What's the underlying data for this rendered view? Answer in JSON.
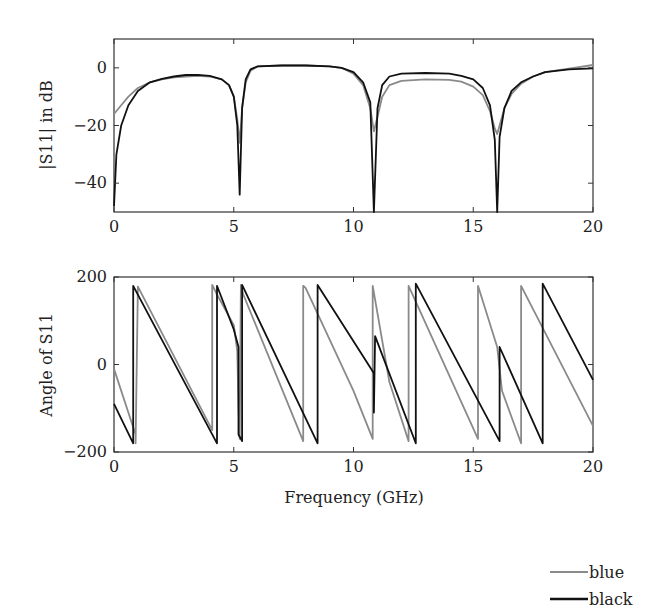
{
  "chart_data": [
    {
      "type": "line",
      "title": "",
      "xlabel": "",
      "ylabel": "|S11| in dB",
      "xlim": [
        0,
        20
      ],
      "ylim": [
        -50,
        10
      ],
      "xticks": [
        0,
        5,
        10,
        15,
        20
      ],
      "xtick_labels": [
        "0",
        "5",
        "10",
        "15",
        "20"
      ],
      "yticks": [
        0,
        -20,
        -40
      ],
      "ytick_labels": [
        "0",
        "−20",
        "−40"
      ],
      "grid": false,
      "series": [
        {
          "name": "blue",
          "color": "#8a8a8a",
          "x": [
            0,
            0.3,
            0.6,
            1.0,
            1.5,
            2.0,
            2.5,
            3.0,
            3.5,
            4.0,
            4.5,
            4.8,
            5.0,
            5.15,
            5.25,
            5.35,
            5.5,
            5.7,
            6.0,
            7.0,
            8.0,
            9.0,
            9.5,
            10.0,
            10.4,
            10.7,
            10.85,
            11.0,
            11.2,
            11.5,
            12.0,
            13.0,
            14.0,
            14.5,
            15.0,
            15.4,
            15.7,
            15.9,
            16.0,
            16.1,
            16.3,
            16.6,
            17.0,
            17.5,
            18.0,
            19.0,
            20.0
          ],
          "y": [
            -16,
            -13,
            -10,
            -7,
            -5,
            -4,
            -3.3,
            -3,
            -2.8,
            -3,
            -4,
            -6,
            -10,
            -18,
            -26,
            -14,
            -5,
            -1,
            0.5,
            0.8,
            0.8,
            0.5,
            0,
            -2,
            -6,
            -14,
            -22,
            -17,
            -10,
            -6,
            -4.5,
            -4,
            -4.2,
            -4.8,
            -6.5,
            -9.5,
            -15,
            -21,
            -23,
            -20,
            -14,
            -9,
            -5.5,
            -3,
            -1.5,
            -0.3,
            1
          ]
        },
        {
          "name": "black",
          "color": "#111111",
          "x": [
            0,
            0.1,
            0.3,
            0.6,
            1.0,
            1.5,
            2.0,
            2.5,
            3.0,
            3.5,
            4.0,
            4.5,
            4.8,
            5.0,
            5.15,
            5.25,
            5.35,
            5.5,
            5.7,
            6.0,
            7.0,
            8.0,
            9.0,
            9.5,
            10.0,
            10.4,
            10.7,
            10.85,
            11.0,
            11.2,
            11.5,
            12.0,
            13.0,
            14.0,
            14.5,
            15.0,
            15.4,
            15.7,
            15.9,
            16.0,
            16.1,
            16.3,
            16.6,
            17.0,
            17.5,
            18.0,
            19.0,
            20.0
          ],
          "y": [
            -48,
            -30,
            -20,
            -13,
            -8,
            -5,
            -3.8,
            -3.0,
            -2.5,
            -2.4,
            -2.8,
            -4,
            -6,
            -10,
            -20,
            -44,
            -14,
            -4,
            -0.5,
            0.5,
            0.8,
            0.8,
            0.5,
            0,
            -1.5,
            -5,
            -12,
            -50,
            -14,
            -6,
            -3,
            -2,
            -1.8,
            -2,
            -2.8,
            -4,
            -7,
            -13,
            -25,
            -50,
            -24,
            -14,
            -8,
            -5,
            -3,
            -1.5,
            -0.5,
            -0.2
          ]
        }
      ]
    },
    {
      "type": "line",
      "title": "",
      "xlabel": "Frequency (GHz)",
      "ylabel": "Angle of S11",
      "xlim": [
        0,
        20
      ],
      "ylim": [
        -200,
        200
      ],
      "xticks": [
        0,
        5,
        10,
        15,
        20
      ],
      "xtick_labels": [
        "0",
        "5",
        "10",
        "15",
        "20"
      ],
      "yticks": [
        200,
        0,
        -200
      ],
      "ytick_labels": [
        "200",
        "0",
        "−200"
      ],
      "grid": false,
      "series": [
        {
          "name": "blue",
          "color": "#8a8a8a",
          "x": [
            0,
            0.9,
            0.9,
            1.0,
            4.1,
            4.1,
            4.3,
            5.0,
            5.15,
            5.2,
            5.25,
            5.3,
            5.4,
            7.9,
            7.9,
            8.0,
            10.0,
            10.8,
            10.8,
            11.5,
            12.3,
            12.3,
            15.2,
            15.2,
            16.0,
            16.2,
            17.0,
            17.0,
            20.0
          ],
          "y": [
            -10,
            -160,
            -180,
            178,
            -150,
            182,
            160,
            90,
            30,
            -100,
            -170,
            182,
            160,
            -175,
            180,
            175,
            -60,
            -170,
            180,
            -40,
            -175,
            180,
            -170,
            180,
            40,
            -60,
            -180,
            180,
            -140
          ]
        },
        {
          "name": "black",
          "color": "#111111",
          "x": [
            0,
            0.8,
            0.8,
            4.3,
            4.3,
            5.0,
            5.2,
            5.2,
            5.35,
            5.35,
            8.5,
            8.5,
            10.85,
            10.85,
            10.9,
            12.6,
            12.6,
            16.1,
            16.1,
            17.9,
            17.9,
            20.0
          ],
          "y": [
            -90,
            -180,
            180,
            -180,
            180,
            80,
            40,
            -160,
            -175,
            182,
            -180,
            182,
            -20,
            -110,
            65,
            -180,
            185,
            -175,
            40,
            -180,
            185,
            -35
          ]
        }
      ]
    }
  ],
  "legend": {
    "position": "bottom-right",
    "items": [
      {
        "label": "blue",
        "color": "#8a8a8a"
      },
      {
        "label": "black",
        "color": "#111111"
      }
    ]
  }
}
